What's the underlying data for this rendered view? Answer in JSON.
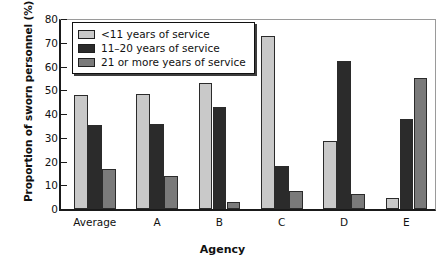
{
  "chart_data": {
    "type": "bar",
    "title": "",
    "xlabel": "Agency",
    "ylabel": "Proportion of sworn personnel (%)",
    "categories": [
      "Average",
      "A",
      "B",
      "C",
      "D",
      "E"
    ],
    "series": [
      {
        "name": "<11 years of service",
        "color": "#c9c9c9",
        "values": [
          48,
          48.5,
          53,
          73,
          28.5,
          4.5
        ]
      },
      {
        "name": "11–20 years of service",
        "color": "#2b2b2b",
        "values": [
          35.5,
          36,
          43,
          18,
          62.5,
          38
        ]
      },
      {
        "name": "21 or more years of service",
        "color": "#7a7a7a",
        "values": [
          17,
          14,
          3,
          7.5,
          6.5,
          55
        ]
      }
    ],
    "ylim": [
      0,
      80
    ],
    "yticks": [
      0,
      10,
      20,
      30,
      40,
      50,
      60,
      70,
      80
    ],
    "ytick_labels": [
      "0",
      "10",
      "20",
      "30",
      "40",
      "50",
      "60",
      "70",
      "80"
    ],
    "grid": false,
    "legend_position": "top-left",
    "legend_entries": [
      "<11 years of service",
      "11–20 years of service",
      "21 or more years of service"
    ]
  }
}
